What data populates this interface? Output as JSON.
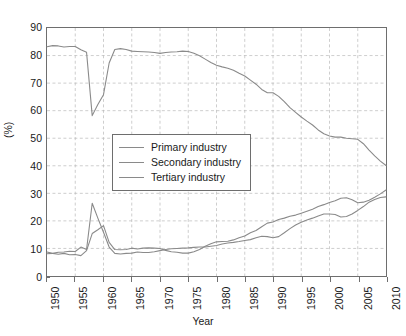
{
  "chart_data": {
    "type": "line",
    "title": "",
    "xlabel": "Year",
    "ylabel": "(%)",
    "xlim": [
      1950,
      2010
    ],
    "ylim": [
      0,
      90
    ],
    "xticks": [
      1950,
      1955,
      1960,
      1965,
      1970,
      1975,
      1980,
      1985,
      1990,
      1995,
      2000,
      2005,
      2010
    ],
    "yticks": [
      0,
      10,
      20,
      30,
      40,
      50,
      60,
      70,
      80,
      90
    ],
    "grid": true,
    "legend_position": "center-left",
    "line_color": "#8a8a8a",
    "axis_color": "#6e6e6e",
    "grid_color": "#b8b8b8",
    "x": [
      1950,
      1951,
      1952,
      1953,
      1954,
      1955,
      1956,
      1957,
      1958,
      1959,
      1960,
      1961,
      1962,
      1963,
      1964,
      1965,
      1966,
      1967,
      1968,
      1969,
      1970,
      1971,
      1972,
      1973,
      1974,
      1975,
      1976,
      1977,
      1978,
      1979,
      1980,
      1981,
      1982,
      1983,
      1984,
      1985,
      1986,
      1987,
      1988,
      1989,
      1990,
      1991,
      1992,
      1993,
      1994,
      1995,
      1996,
      1997,
      1998,
      1999,
      2000,
      2001,
      2002,
      2003,
      2004,
      2005,
      2006,
      2007,
      2008,
      2009,
      2010
    ],
    "series": [
      {
        "name": "Primary industry",
        "values": [
          83.2,
          83.6,
          83.5,
          83.1,
          83.3,
          83.3,
          82.1,
          81.2,
          58.2,
          62.2,
          65.8,
          77.3,
          82.2,
          82.5,
          82.2,
          81.6,
          81.5,
          81.4,
          81.3,
          81.1,
          80.8,
          81.1,
          81.3,
          81.4,
          81.6,
          81.5,
          80.8,
          79.9,
          78.7,
          77.5,
          76.5,
          75.9,
          75.4,
          74.7,
          73.6,
          72.6,
          71.1,
          69.6,
          67.7,
          66.5,
          66.5,
          65.2,
          63.3,
          61.1,
          59.4,
          57.7,
          56.2,
          54.8,
          53.0,
          51.6,
          50.8,
          50.4,
          50.4,
          50.0,
          49.8,
          49.6,
          48.0,
          45.7,
          43.6,
          41.7,
          40.1
        ]
      },
      {
        "name": "Secondary industry",
        "values": [
          8.1,
          8.2,
          8.6,
          8.7,
          9.0,
          8.9,
          10.5,
          9.6,
          26.4,
          21.0,
          15.9,
          10.5,
          8.2,
          8.0,
          8.2,
          8.3,
          8.7,
          8.5,
          8.5,
          8.8,
          9.2,
          9.6,
          9.9,
          10.0,
          10.1,
          10.2,
          10.4,
          10.5,
          10.5,
          10.8,
          11.1,
          11.6,
          12.0,
          12.2,
          12.5,
          12.9,
          13.2,
          13.9,
          14.4,
          14.3,
          13.9,
          14.3,
          15.7,
          17.2,
          18.5,
          19.5,
          20.3,
          21.0,
          21.8,
          22.5,
          22.5,
          22.3,
          21.4,
          21.6,
          22.5,
          23.8,
          25.2,
          26.8,
          27.8,
          28.5,
          28.7
        ]
      },
      {
        "name": "Tertiary industry",
        "values": [
          8.7,
          8.2,
          7.9,
          8.2,
          7.7,
          7.8,
          7.4,
          9.2,
          15.4,
          16.8,
          18.3,
          12.2,
          9.6,
          9.5,
          9.6,
          10.1,
          9.8,
          10.1,
          10.2,
          10.1,
          10.0,
          9.3,
          8.8,
          8.6,
          8.3,
          8.3,
          8.8,
          9.6,
          10.8,
          11.7,
          12.4,
          12.5,
          12.6,
          13.1,
          13.9,
          14.5,
          15.7,
          16.5,
          17.9,
          19.2,
          19.6,
          20.5,
          21.0,
          21.7,
          22.1,
          22.8,
          23.5,
          24.2,
          25.2,
          25.9,
          26.7,
          27.3,
          28.2,
          28.4,
          27.7,
          26.6,
          26.8,
          27.5,
          28.6,
          29.8,
          31.2
        ]
      }
    ]
  },
  "legend": {
    "items": [
      {
        "label": "Primary industry"
      },
      {
        "label": "Secondary industry"
      },
      {
        "label": "Tertiary industry"
      }
    ]
  },
  "axes": {
    "x_title": "Year",
    "y_title": "(%)"
  }
}
